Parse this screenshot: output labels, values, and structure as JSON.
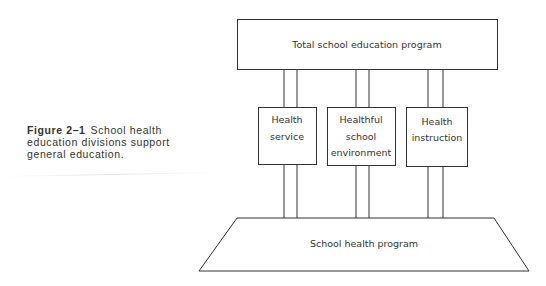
{
  "caption": {
    "label": "Figure 2–1",
    "text": "School health education divisions support general education."
  },
  "diagram": {
    "top_box": {
      "label": "Total school education program"
    },
    "divisions": [
      {
        "lines": [
          "Health",
          "service"
        ]
      },
      {
        "lines": [
          "Healthful",
          "school",
          "environment"
        ]
      },
      {
        "lines": [
          "Health",
          "instruction"
        ]
      }
    ],
    "base": {
      "label": "School health program"
    }
  }
}
